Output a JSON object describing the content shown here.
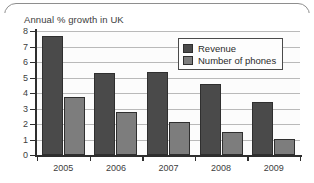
{
  "chart_data": {
    "type": "bar",
    "title": "Annual % growth in UK",
    "xlabel": "",
    "ylabel": "",
    "categories": [
      "2005",
      "2006",
      "2007",
      "2008",
      "2009"
    ],
    "series": [
      {
        "name": "Revenue",
        "color": "#4a4a4a",
        "values": [
          7.7,
          5.3,
          5.35,
          4.6,
          3.4
        ]
      },
      {
        "name": "Number of phones",
        "color": "#7d7d7d",
        "values": [
          3.75,
          2.8,
          2.1,
          1.5,
          1.05
        ]
      }
    ],
    "ylim": [
      0,
      8
    ],
    "yticks": [
      0,
      1,
      2,
      3,
      4,
      5,
      6,
      7,
      8
    ],
    "ytick_labels": [
      "0",
      "1",
      "2",
      "3",
      "4",
      "5",
      "6",
      "7",
      "8"
    ],
    "grid": true,
    "grid_axis": "y",
    "legend_position": "upper-right-inside",
    "background": "#fcfcfc",
    "axis_color": "#2e2e2e",
    "grid_color": "#b9b9b9"
  }
}
